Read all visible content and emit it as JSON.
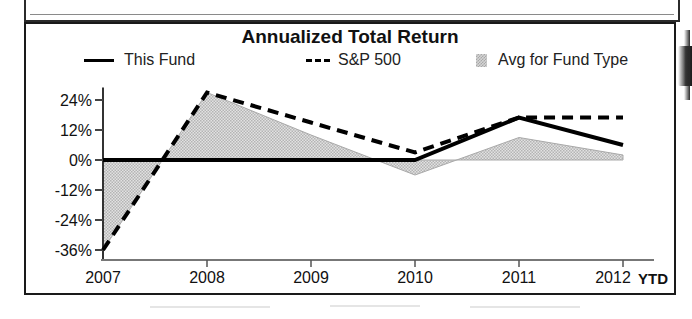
{
  "chart_data": {
    "type": "line",
    "title": "Annualized Total Return",
    "xlabel": "",
    "ylabel": "",
    "categories": [
      "2007",
      "2008",
      "2009",
      "2010",
      "2011",
      "2012"
    ],
    "x_tick_labels": [
      "2007",
      "2008",
      "2009",
      "2010",
      "2011",
      "2012"
    ],
    "x_axis_suffix": "YTD",
    "y_tick_labels": [
      "24%",
      "12%",
      "0%",
      "-12%",
      "-24%",
      "-36%"
    ],
    "y_tick_values": [
      24,
      12,
      0,
      -12,
      -24,
      -36
    ],
    "ylim": [
      -40,
      30
    ],
    "grid": false,
    "legend_position": "top",
    "series": [
      {
        "name": "This Fund",
        "style": "solid-line",
        "color": "#000000",
        "values": [
          0,
          0,
          0,
          0,
          17,
          6
        ]
      },
      {
        "name": "S&P 500",
        "style": "dashed-line",
        "color": "#000000",
        "values": [
          -36,
          27,
          15,
          3,
          17,
          17
        ]
      },
      {
        "name": "Avg for Fund Type",
        "style": "shaded-area",
        "color": "#d4d4d4",
        "values": [
          -36,
          27,
          10,
          -6,
          9,
          2
        ]
      }
    ]
  },
  "legend": {
    "this_fund": "This Fund",
    "sp500": "S&P 500",
    "avg_fund_type": "Avg for Fund Type"
  },
  "axis": {
    "y_labels": [
      "24%",
      "12%",
      "0%",
      "-12%",
      "-24%",
      "-36%"
    ],
    "x_labels": [
      "2007",
      "2008",
      "2009",
      "2010",
      "2011",
      "2012"
    ],
    "ytd_label": "YTD"
  },
  "colors": {
    "line": "#000000",
    "area_fill": "#d4d4d4",
    "frame": "#1a1a1a",
    "text": "#111111"
  }
}
